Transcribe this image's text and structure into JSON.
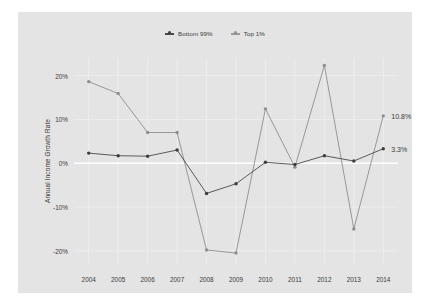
{
  "chart_data": {
    "type": "line",
    "title": "",
    "xlabel": "",
    "ylabel": "Annual Income Growth Rate",
    "categories": [
      "2004",
      "2005",
      "2006",
      "2007",
      "2008",
      "2009",
      "2010",
      "2011",
      "2012",
      "2013",
      "2014"
    ],
    "ylim": [
      -23,
      24
    ],
    "yticks": [
      20,
      10,
      0,
      -10,
      -20
    ],
    "ytick_labels": [
      "20%",
      "10%",
      "0%",
      "-10%",
      "-20%"
    ],
    "grid": true,
    "legend_position": "top-center",
    "series": [
      {
        "name": "Bottom 99%",
        "color": "#4a4a4a",
        "marker_color": "#3d3d3d",
        "values": [
          2.3,
          1.7,
          1.6,
          3.0,
          -6.9,
          -4.7,
          0.2,
          -0.3,
          1.7,
          0.5,
          3.3
        ],
        "end_label": "3.3%"
      },
      {
        "name": "Top 1%",
        "color": "#8f8f8f",
        "marker_color": "#8e8e8e",
        "values": [
          18.6,
          15.9,
          7.0,
          7.0,
          -19.8,
          -20.5,
          12.4,
          -0.9,
          22.3,
          -15.0,
          10.8
        ],
        "end_label": "10.8%"
      }
    ],
    "annotations": [
      {
        "text": "10.8%",
        "series": "Top 1%",
        "year": "2014",
        "value": 10.8
      },
      {
        "text": "3.3%",
        "series": "Bottom 99%",
        "year": "2014",
        "value": 3.3
      }
    ]
  },
  "legend": {
    "items": [
      {
        "label": "Bottom 99%"
      },
      {
        "label": "Top 1%"
      }
    ]
  },
  "colors": {
    "panel_background": "#e4e4e4",
    "page_background": "#ffffff",
    "gridline": "#f2f2f2",
    "zero_line": "#ffffff",
    "text": "#3a3a3a"
  }
}
